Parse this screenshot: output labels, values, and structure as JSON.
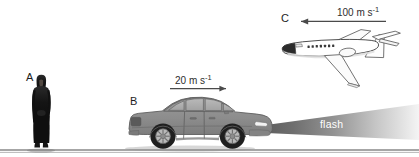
{
  "figure": {
    "type": "physics-illustration",
    "topic": "relative-motion-light-speed",
    "background_color": "#ffffff",
    "ground_line_color": "#4a4a4a",
    "cropped_top_text": "",
    "objects": [
      {
        "id": "A",
        "letter": "A",
        "name": "stationary-observer",
        "description": "person standing on the ground",
        "speed_text": "",
        "color": "#1a1a1a"
      },
      {
        "id": "B",
        "letter": "B",
        "name": "moving-car",
        "description": "car travelling to the right emitting a flash of light",
        "speed_text": "20 m s",
        "speed_exponent": "-1",
        "speed_value": 20,
        "speed_unit": "m s^-1",
        "direction": "right",
        "color": "#8c8c8c"
      },
      {
        "id": "C",
        "letter": "C",
        "name": "aeroplane",
        "description": "jet aeroplane travelling to the left",
        "speed_text": "100 m s",
        "speed_exponent": "-1",
        "speed_value": 100,
        "speed_unit": "m s^-1",
        "direction": "left",
        "color": "#ffffff"
      }
    ],
    "flash": {
      "label": "flash",
      "source": "car headlight",
      "direction": "right",
      "beam_color_near": "#6e6e6e",
      "beam_color_far": "#f2f2f2"
    }
  }
}
